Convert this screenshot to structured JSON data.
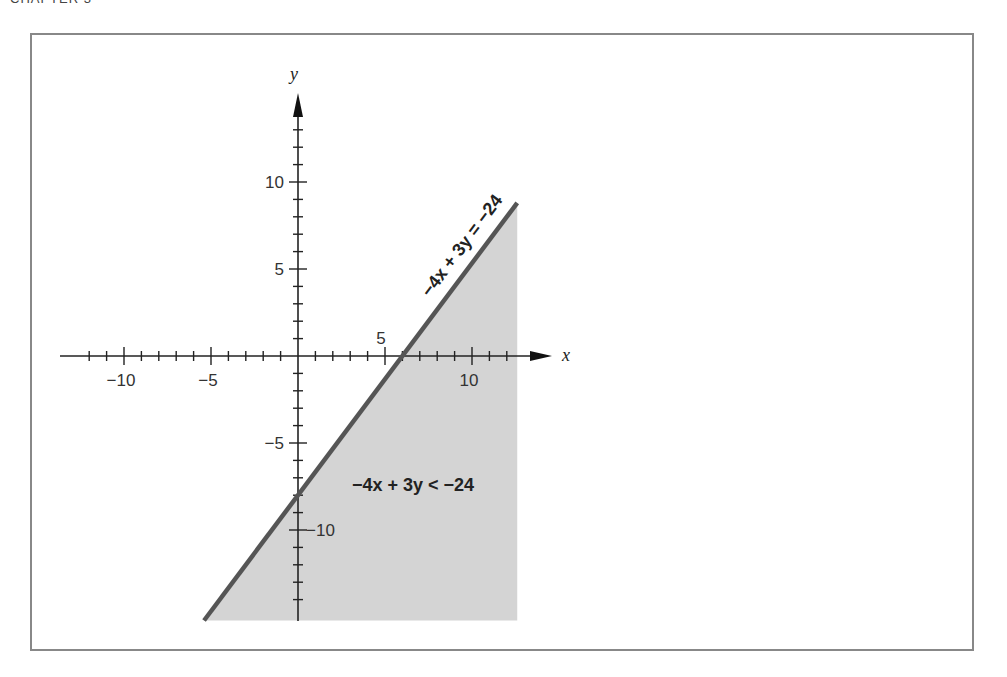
{
  "header": {
    "label": "CHAPTER 3"
  },
  "chart_data": {
    "type": "area",
    "title": "",
    "xlabel": "x",
    "ylabel": "y",
    "xlim": [
      -13.5,
      14.5
    ],
    "ylim": [
      -15.2,
      15.5
    ],
    "x_ticks": {
      "major": [
        -10,
        -5,
        5,
        10
      ],
      "minor_step": 1
    },
    "y_ticks": {
      "major": [
        10,
        5,
        -5,
        -10
      ],
      "minor_step": 1
    },
    "x_tick_labels": [
      "−10",
      "−5",
      "5",
      "10"
    ],
    "y_tick_labels": [
      "10",
      "5",
      "−5",
      "−10"
    ],
    "boundary_line": {
      "equation": "−4x + 3y = −24",
      "slope": 1.3333,
      "x_intercept": 6,
      "y_intercept": -8,
      "points": [
        [
          -5.4,
          -15.2
        ],
        [
          12.6,
          8.8
        ]
      ]
    },
    "shaded_region": {
      "inequality": "−4x + 3y < −24",
      "description": "region below/right of the line, bounded right at x≈12.6 and bottom at y≈−15.2",
      "fill_color": "#d4d4d4"
    },
    "line_color": "#555555",
    "grid": false,
    "legend": null
  }
}
